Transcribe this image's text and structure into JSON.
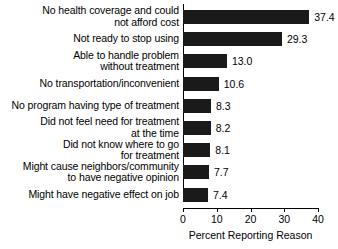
{
  "chart_data": {
    "type": "bar",
    "orientation": "horizontal",
    "title": "",
    "xlabel": "Percent Reporting Reason",
    "ylabel": "",
    "xlim": [
      0,
      40
    ],
    "xticks": [
      "0",
      "10",
      "20",
      "30",
      "40"
    ],
    "grid": false,
    "legend": null,
    "categories": [
      "No health coverage and could not afford cost",
      "Not ready to stop using",
      "Able to handle problem without treatment",
      "No transportation/inconvenient",
      "No program having type of treatment",
      "Did not feel need for treatment at the time",
      "Did not know where to go for treatment",
      "Might cause neighbors/community to have negative opinion",
      "Might have negative effect on job"
    ],
    "category_lines": [
      [
        "No health coverage and could",
        "not afford cost"
      ],
      [
        "Not ready to stop using"
      ],
      [
        "Able to handle problem",
        "without treatment"
      ],
      [
        "No transportation/inconvenient"
      ],
      [
        "No program having type of treatment"
      ],
      [
        "Did not feel need for treatment",
        "at the time"
      ],
      [
        "Did not know where to go",
        "for treatment"
      ],
      [
        "Might cause neighbors/community",
        "to have negative opinion"
      ],
      [
        "Might have negative effect on job"
      ]
    ],
    "values": [
      37.4,
      29.3,
      13.0,
      10.6,
      8.3,
      8.2,
      8.1,
      7.7,
      7.4
    ],
    "value_labels": [
      "37.4",
      "29.3",
      "13.0",
      "10.6",
      "8.3",
      "8.2",
      "8.1",
      "7.7",
      "7.4"
    ],
    "bar_color": "#1a1a1a",
    "axis_color": "#000000",
    "background_color": "#ffffff"
  }
}
